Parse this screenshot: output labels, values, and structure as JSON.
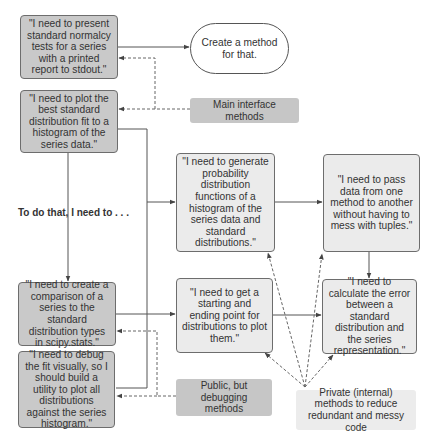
{
  "diagram": {
    "colors": {
      "main_interface_fill": "#c9c9c9",
      "private_fill": "#ebebeb",
      "label_main_fill": "#c6c6c6",
      "label_private_fill": "#ececec",
      "border": "#6d6d6d",
      "edge": "#555555"
    },
    "nodes": {
      "present_tests": "\"I need to present standard normalcy tests for a series with a printed report to stdout.\"",
      "create_method": "Create a method for that.",
      "plot_best_fit": "\"I need to plot the best standard distribution fit to a histogram of the series data.\"",
      "generate_pdfs": "\"I need to generate probability distribution functions of a histogram of the series data and standard distributions.\"",
      "pass_data": "\"I need to pass data from one method to another without having to mess with tuples.\"",
      "create_comparison": "\"I need to create a comparison of a series to the standard distribution types in scipy.stats.\"",
      "debug_fit": "\"I need to debug the fit visually, so I should build a utility to plot all distributions against the series histogram.\"",
      "start_end_point": "\"I need to get a starting and ending point for distributions to plot them.\"",
      "calculate_error": "\"I need to calculate the error between a standard distribution and the series representation.\""
    },
    "legend": {
      "main_interface": "Main interface methods",
      "public_debugging": "Public, but debugging methods",
      "private_internal": "Private (internal) methods to reduce redundant and messy code"
    },
    "caption": "To do that, I need to . . ."
  }
}
